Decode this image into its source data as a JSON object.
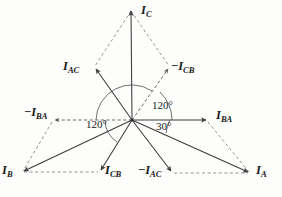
{
  "figure": {
    "origin": {
      "x": 132,
      "y": 120
    },
    "colors": {
      "line": "#3c3c3c",
      "dashed": "#6e6e6e",
      "text": "#1a1a1a",
      "background": "#fdfdfc"
    }
  },
  "phasors": [
    {
      "id": "IC",
      "symbol": "I",
      "subscript": "C",
      "negative": false,
      "style": "solid",
      "tip": {
        "x": 131,
        "y": 9
      },
      "label_pos": {
        "x": 141,
        "y": 5
      }
    },
    {
      "id": "IAC",
      "symbol": "I",
      "subscript": "AC",
      "negative": false,
      "style": "solid",
      "tip": {
        "x": 94,
        "y": 67
      },
      "label_pos": {
        "x": 65,
        "y": 61
      }
    },
    {
      "id": "ICB_neg",
      "symbol": "I",
      "subscript": "CB",
      "negative": true,
      "style": "dashed",
      "tip": {
        "x": 170,
        "y": 67
      },
      "label_pos": {
        "x": 172,
        "y": 61
      }
    },
    {
      "id": "IBA_neg",
      "symbol": "I",
      "subscript": "BA",
      "negative": true,
      "style": "dashed",
      "tip": {
        "x": 52,
        "y": 120
      },
      "label_pos": {
        "x": 25,
        "y": 107
      }
    },
    {
      "id": "IBA",
      "symbol": "I",
      "subscript": "BA",
      "negative": false,
      "style": "solid",
      "tip": {
        "x": 208,
        "y": 120
      },
      "label_pos": {
        "x": 216,
        "y": 110
      }
    },
    {
      "id": "IB",
      "symbol": "I",
      "subscript": "B",
      "negative": false,
      "style": "solid",
      "tip": {
        "x": 22,
        "y": 172
      },
      "label_pos": {
        "x": 2,
        "y": 165
      }
    },
    {
      "id": "ICB",
      "symbol": "I",
      "subscript": "CB",
      "negative": false,
      "style": "solid",
      "tip": {
        "x": 100,
        "y": 172
      },
      "label_pos": {
        "x": 106,
        "y": 165
      }
    },
    {
      "id": "IAC_neg",
      "symbol": "I",
      "subscript": "AC",
      "negative": true,
      "style": "solid",
      "tip": {
        "x": 172,
        "y": 173
      },
      "label_pos": {
        "x": 140,
        "y": 165
      }
    },
    {
      "id": "IA",
      "symbol": "I",
      "subscript": "A",
      "negative": false,
      "style": "solid",
      "tip": {
        "x": 250,
        "y": 173
      },
      "label_pos": {
        "x": 256,
        "y": 165
      }
    }
  ],
  "angles": [
    {
      "id": "angle-upper-right",
      "value": "120°",
      "label_pos": {
        "x": 152,
        "y": 101
      }
    },
    {
      "id": "angle-left",
      "value": "120°",
      "label_pos": {
        "x": 87,
        "y": 120
      }
    },
    {
      "id": "angle-lower-right",
      "value": "30°",
      "label_pos": {
        "x": 156,
        "y": 122
      }
    }
  ],
  "construction_lines": [
    {
      "id": "diamond-left",
      "from": {
        "x": 131,
        "y": 9
      },
      "to": {
        "x": 94,
        "y": 67
      }
    },
    {
      "id": "diamond-right",
      "from": {
        "x": 131,
        "y": 9
      },
      "to": {
        "x": 170,
        "y": 67
      }
    },
    {
      "id": "base-left",
      "from": {
        "x": 22,
        "y": 172
      },
      "to": {
        "x": 100,
        "y": 172
      }
    },
    {
      "id": "base-right",
      "from": {
        "x": 172,
        "y": 173
      },
      "to": {
        "x": 250,
        "y": 173
      }
    },
    {
      "id": "side-left",
      "from": {
        "x": 52,
        "y": 120
      },
      "to": {
        "x": 22,
        "y": 172
      }
    },
    {
      "id": "side-right",
      "from": {
        "x": 208,
        "y": 120
      },
      "to": {
        "x": 250,
        "y": 173
      }
    }
  ]
}
